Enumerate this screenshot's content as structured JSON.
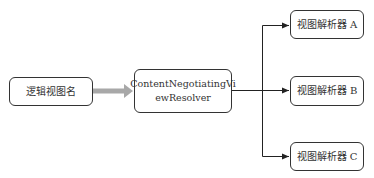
{
  "diagram": {
    "type": "flowchart",
    "nodes": {
      "input": {
        "label": "逻辑视图名"
      },
      "resolver": {
        "label_line1": "ContentNegotiatingVi",
        "label_line2": "ewResolver"
      },
      "resolver_a": {
        "label": "视图解析器 A"
      },
      "resolver_b": {
        "label": "视图解析器 B"
      },
      "resolver_c": {
        "label": "视图解析器 C"
      }
    },
    "edges": [
      {
        "from": "input",
        "to": "resolver",
        "style": "thick-grey-arrow"
      },
      {
        "from": "resolver",
        "to": "resolver_a",
        "style": "thin-black-arrow"
      },
      {
        "from": "resolver",
        "to": "resolver_b",
        "style": "thin-black-arrow"
      },
      {
        "from": "resolver",
        "to": "resolver_c",
        "style": "thin-black-arrow"
      }
    ],
    "colors": {
      "border": "#333333",
      "thick_arrow": "#a8a8a8",
      "thin_arrow": "#222222",
      "text": "#333333",
      "background": "#ffffff"
    }
  }
}
